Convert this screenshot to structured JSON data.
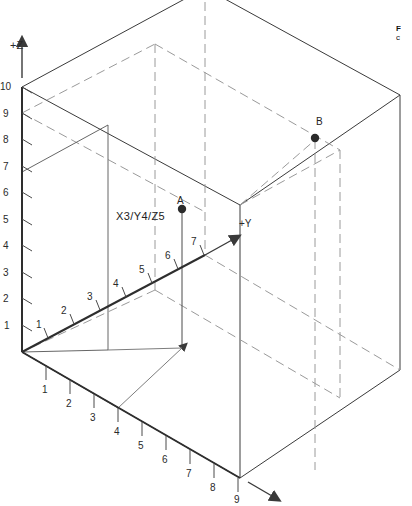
{
  "figure": {
    "background": "#ffffff",
    "line_color": "#3a3a3a",
    "dash_color": "#8a8a8a",
    "point_color": "#2b2b2b"
  },
  "axes": {
    "z": {
      "label": "+Z",
      "ticks": [
        "1",
        "2",
        "3",
        "4",
        "5",
        "6",
        "7",
        "8",
        "9",
        "10"
      ],
      "max": 10,
      "direction": "up"
    },
    "y": {
      "label": "+Y",
      "ticks": [
        "1",
        "2",
        "3",
        "4",
        "5",
        "6",
        "7"
      ],
      "max": 7,
      "direction": "up-right"
    },
    "x": {
      "label": "",
      "ticks": [
        "1",
        "2",
        "3",
        "4",
        "5",
        "6",
        "7",
        "8",
        "9"
      ],
      "max": 9,
      "direction": "down-right"
    }
  },
  "points": [
    {
      "name": "A",
      "label": "A",
      "coords_label": "X3/Y4/Z5",
      "x": 3,
      "y": 4,
      "z": 5
    },
    {
      "name": "B",
      "label": "B",
      "coords_label": "",
      "x": 9,
      "y": 7,
      "z": 7
    }
  ],
  "caption": {
    "line1": "F",
    "line2": "c"
  }
}
